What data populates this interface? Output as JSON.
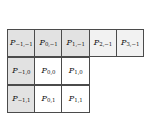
{
  "figure": {
    "title": "",
    "colors": {
      "border": "#4b4b4b",
      "shaded_fill": "#e2e2e2",
      "light_fill": "#f2f2f2",
      "plain_fill": "#ffffff",
      "text": "#111111",
      "background": "#ffffff"
    },
    "symbol": "P",
    "rows": [
      {
        "row_index": 0,
        "cells": [
          {
            "label": "P",
            "sub": "−1,−1",
            "x": "-1",
            "y": "-1",
            "fill": "shaded"
          },
          {
            "label": "P",
            "sub": "0,−1",
            "x": "0",
            "y": "-1",
            "fill": "shaded"
          },
          {
            "label": "P",
            "sub": "1,−1",
            "x": "1",
            "y": "-1",
            "fill": "shaded"
          },
          {
            "label": "P",
            "sub": "2,−1",
            "x": "2",
            "y": "-1",
            "fill": "light"
          },
          {
            "label": "P",
            "sub": "3,−1",
            "x": "3",
            "y": "-1",
            "fill": "light"
          }
        ]
      },
      {
        "row_index": 1,
        "cells": [
          {
            "label": "P",
            "sub": "−1,0",
            "x": "-1",
            "y": "0",
            "fill": "shaded"
          },
          {
            "label": "P",
            "sub": "0,0",
            "x": "0",
            "y": "0",
            "fill": "plain"
          },
          {
            "label": "P",
            "sub": "1,0",
            "x": "1",
            "y": "0",
            "fill": "plain"
          },
          {
            "label": "",
            "sub": "",
            "x": "2",
            "y": "0",
            "fill": "empty"
          },
          {
            "label": "",
            "sub": "",
            "x": "3",
            "y": "0",
            "fill": "empty"
          }
        ]
      },
      {
        "row_index": 2,
        "cells": [
          {
            "label": "P",
            "sub": "−1,1",
            "x": "-1",
            "y": "1",
            "fill": "shaded"
          },
          {
            "label": "P",
            "sub": "0,1",
            "x": "0",
            "y": "1",
            "fill": "plain"
          },
          {
            "label": "P",
            "sub": "1,1",
            "x": "1",
            "y": "1",
            "fill": "plain"
          },
          {
            "label": "",
            "sub": "",
            "x": "2",
            "y": "1",
            "fill": "empty"
          },
          {
            "label": "",
            "sub": "",
            "x": "3",
            "y": "1",
            "fill": "empty"
          }
        ]
      }
    ]
  }
}
